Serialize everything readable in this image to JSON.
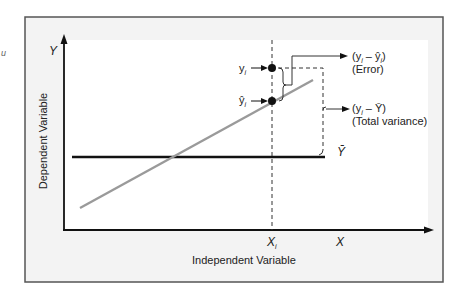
{
  "diagram": {
    "corner_mark": "u",
    "axes": {
      "y_symbol": "Y",
      "x_symbol": "X",
      "y_label": "Dependent Variable",
      "x_label": "Independent Variable",
      "xi_label": "X",
      "xi_sub": "i"
    },
    "points": {
      "observed_label": "y",
      "observed_sub": "i",
      "predicted_label": "ŷ",
      "predicted_sub": "i"
    },
    "annotations": {
      "error_formula_a": "(y",
      "error_formula_b": " – ŷ",
      "error_formula_c": ")",
      "error_sub": "i",
      "error_name": "(Error)",
      "total_formula_a": "(y",
      "total_formula_b": " – Ȳ)",
      "total_sub": "i",
      "total_name": "(Total variance)",
      "mean_label": "Ȳ"
    },
    "colors": {
      "frame_bg": "#f3f3f3",
      "frame_border": "#555555",
      "plot_bg": "#ffffff",
      "axis": "#111111",
      "regression_line": "#9a9a9a",
      "mean_line": "#111111",
      "point": "#111111"
    }
  }
}
